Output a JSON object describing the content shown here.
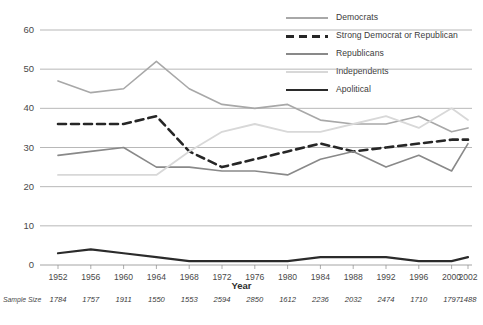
{
  "chart_data": {
    "type": "line",
    "title": "",
    "xlabel": "Year",
    "ylabel": "",
    "ylim": [
      0,
      60
    ],
    "yticks": [
      0,
      10,
      20,
      30,
      40,
      50,
      60
    ],
    "grid": true,
    "legend_position": "top-right",
    "categories": [
      1952,
      1956,
      1960,
      1964,
      1968,
      1972,
      1976,
      1980,
      1984,
      1988,
      1992,
      1996,
      2000,
      2002
    ],
    "x_tick_labels": [
      "1952",
      "1956",
      "1960",
      "1964",
      "1968",
      "1972",
      "1976",
      "1980",
      "1984",
      "1988",
      "1992",
      "1996",
      "2000",
      "2002"
    ],
    "series": [
      {
        "name": "Democrats",
        "color": "#a8a8a8",
        "width": 1.6,
        "dash": "none",
        "values": [
          47,
          44,
          45,
          52,
          45,
          41,
          40,
          41,
          37,
          36,
          36,
          38,
          34,
          35
        ]
      },
      {
        "name": "Strong Democrat or Republican",
        "color": "#262626",
        "width": 2.6,
        "dash": "dashed",
        "values": [
          36,
          36,
          36,
          38,
          29,
          25,
          27,
          29,
          31,
          29,
          30,
          31,
          32,
          32
        ]
      },
      {
        "name": "Republicans",
        "color": "#898989",
        "width": 1.6,
        "dash": "none",
        "values": [
          28,
          29,
          30,
          25,
          25,
          24,
          24,
          23,
          27,
          29,
          25,
          28,
          24,
          31
        ]
      },
      {
        "name": "Independents",
        "color": "#d8d8d8",
        "width": 1.8,
        "dash": "none",
        "values": [
          23,
          23,
          23,
          23,
          29,
          34,
          36,
          34,
          34,
          36,
          38,
          35,
          40,
          37
        ]
      },
      {
        "name": "Apolitical",
        "color": "#2b2b2b",
        "width": 2.2,
        "dash": "none",
        "values": [
          3,
          4,
          3,
          2,
          1,
          1,
          1,
          1,
          2,
          2,
          2,
          1,
          1,
          2
        ]
      }
    ],
    "sample_size_caption": "Sample Size",
    "sample_sizes": [
      1784,
      1757,
      1911,
      1550,
      1553,
      2594,
      2850,
      1612,
      2236,
      2032,
      2474,
      1710,
      1797,
      1488
    ]
  }
}
